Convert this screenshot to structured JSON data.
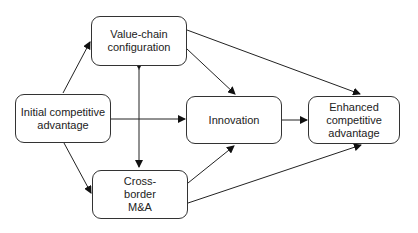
{
  "diagram": {
    "nodes": {
      "value_chain": {
        "label": "Value-chain configuration"
      },
      "initial": {
        "label": "Initial competitive advantage"
      },
      "innovation": {
        "label": "Innovation"
      },
      "enhanced": {
        "label": "Enhanced competitive advantage"
      },
      "cross_border": {
        "label": "Cross-border M&A"
      }
    },
    "edges": [
      {
        "from": "Initial competitive advantage",
        "to": "Value-chain configuration"
      },
      {
        "from": "Initial competitive advantage",
        "to": "Cross-border M&A"
      },
      {
        "from": "Initial competitive advantage",
        "to": "Innovation"
      },
      {
        "from": "Value-chain configuration",
        "to": "Cross-border M&A",
        "bidirectional": true
      },
      {
        "from": "Value-chain configuration",
        "to": "Innovation"
      },
      {
        "from": "Value-chain configuration",
        "to": "Enhanced competitive advantage"
      },
      {
        "from": "Cross-border M&A",
        "to": "Innovation"
      },
      {
        "from": "Cross-border M&A",
        "to": "Enhanced competitive advantage"
      },
      {
        "from": "Innovation",
        "to": "Enhanced competitive advantage"
      }
    ]
  }
}
